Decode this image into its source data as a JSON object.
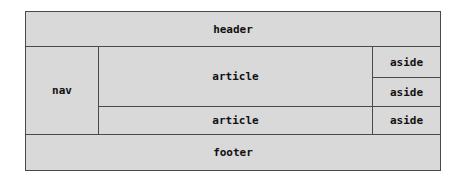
{
  "diagram": {
    "header": "header",
    "nav": "nav",
    "articles": [
      "article",
      "article"
    ],
    "asides": [
      "aside",
      "aside",
      "aside"
    ],
    "footer": "footer",
    "colors": {
      "fill": "#d9d9d9",
      "border": "#4a4a4a",
      "text": "#111111"
    }
  }
}
